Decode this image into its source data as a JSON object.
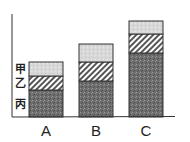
{
  "chart_data": {
    "type": "bar",
    "stacked": true,
    "title": "",
    "xlabel": "",
    "ylabel": "",
    "categories": [
      "A",
      "B",
      "C"
    ],
    "series": [
      {
        "name": "丙",
        "pattern": "dark-speckle",
        "values": [
          27,
          36,
          64
        ]
      },
      {
        "name": "乙",
        "pattern": "diagonal-hatch",
        "values": [
          14,
          19,
          19
        ]
      },
      {
        "name": "甲",
        "pattern": "light-speckle",
        "values": [
          14,
          18,
          13
        ]
      }
    ],
    "ylim": [
      0,
      103
    ],
    "grid": false,
    "legend": {
      "placement": "left-of-first-bar",
      "labels": [
        "甲",
        "乙",
        "丙"
      ]
    },
    "units_note": "relative units; no numeric axis shown"
  }
}
